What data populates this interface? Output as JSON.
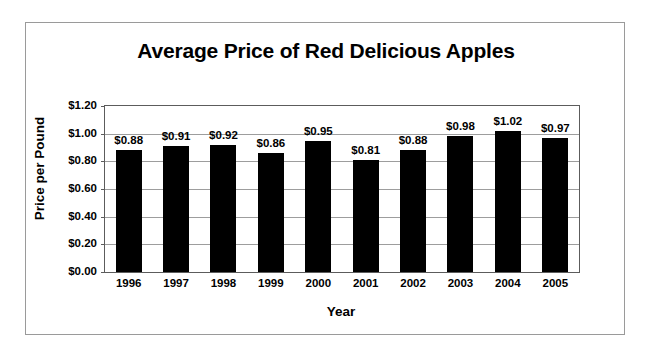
{
  "chart_data": {
    "type": "bar",
    "title": "Average Price of Red Delicious Apples",
    "xlabel": "Year",
    "ylabel": "Price per Pound",
    "categories": [
      "1996",
      "1997",
      "1998",
      "1999",
      "2000",
      "2001",
      "2002",
      "2003",
      "2004",
      "2005"
    ],
    "values": [
      0.88,
      0.91,
      0.92,
      0.86,
      0.95,
      0.81,
      0.88,
      0.98,
      1.02,
      0.97
    ],
    "data_labels": [
      "$0.88",
      "$0.91",
      "$0.92",
      "$0.86",
      "$0.95",
      "$0.81",
      "$0.88",
      "$0.98",
      "$1.02",
      "$0.97"
    ],
    "ylim": [
      0.0,
      1.2
    ],
    "ytick_values": [
      1.2,
      1.0,
      0.8,
      0.6,
      0.4,
      0.2,
      0.0
    ],
    "ytick_labels": [
      "$1.20",
      "$1.00",
      "$0.80",
      "$0.60",
      "$0.40",
      "$0.20",
      "$0.00"
    ],
    "grid": true,
    "gridline_axis": "y",
    "legend": false,
    "legend_position": "none",
    "bar_color": "#000000",
    "plot_border_color": "#5c5c5c",
    "gridline_color": "#9d9d9d",
    "figure_border_color": "#9a9a9a",
    "background_color": "#ffffff",
    "text_color": "#000000"
  }
}
